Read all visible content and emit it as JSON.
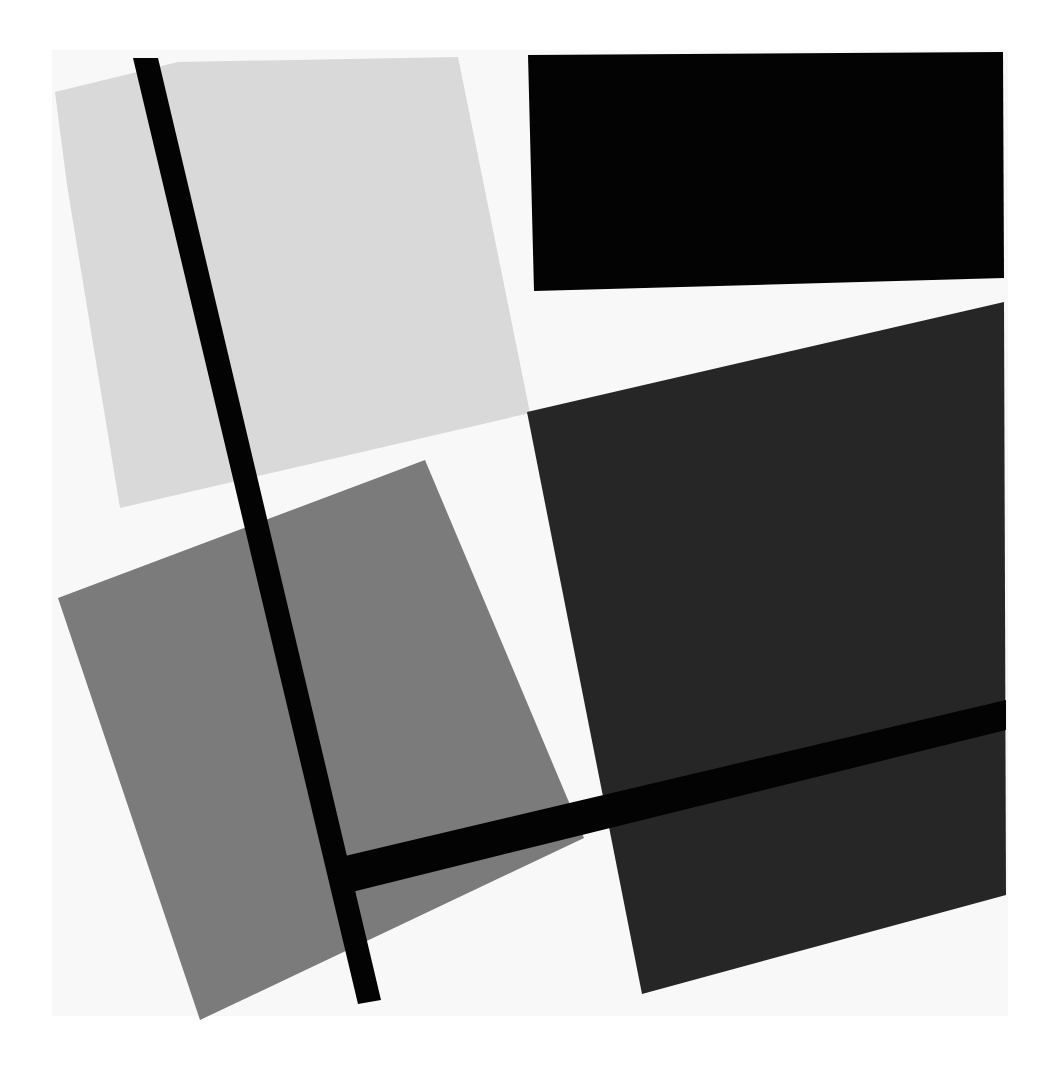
{
  "artwork": {
    "style": "geometric abstract composition",
    "canvas": {
      "width": 1052,
      "height": 1089,
      "background": "#ffffff",
      "paper": "#f7f7f7"
    },
    "colors": {
      "white": "#f8f8f8",
      "light_gray": "#d9d9d9",
      "mid_gray": "#7a7a7a",
      "dark_gray": "#262626",
      "black": "#030303"
    },
    "shapes": [
      {
        "name": "light-gray-plane",
        "fill": "#d9d9d9",
        "points": "55,92 178,62 458,57 530,413 120,508 67,185"
      },
      {
        "name": "black-rectangle",
        "fill": "#030303",
        "points": "528,55 1003,52 1004,278 534,291"
      },
      {
        "name": "dark-gray-plane",
        "fill": "#262626",
        "points": "527,412 1004,302 1006,895 642,994"
      },
      {
        "name": "mid-gray-plane",
        "fill": "#7b7b7b",
        "points": "58,598 425,460 584,838 200,1020"
      },
      {
        "name": "vertical-black-bar",
        "fill": "#030303",
        "points": "133,58 158,58 381,1000 358,1004"
      },
      {
        "name": "horizontal-black-bar",
        "fill": "#030303",
        "points": "345,856 1006,700 1006,730 352,892"
      }
    ]
  }
}
